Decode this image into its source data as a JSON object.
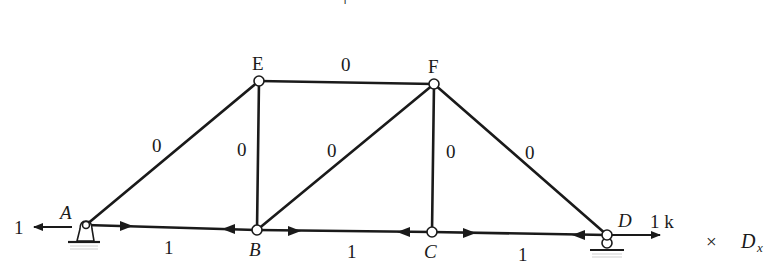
{
  "figure": {
    "type": "truss-free-body-diagram",
    "top_mark": "+",
    "joints": [
      {
        "id": "A",
        "label": "A",
        "italic": true,
        "x": 86,
        "y": 225,
        "support": "pin"
      },
      {
        "id": "B",
        "label": "B",
        "italic": true,
        "x": 257,
        "y": 230,
        "support": "none"
      },
      {
        "id": "C",
        "label": "C",
        "italic": true,
        "x": 432,
        "y": 232,
        "support": "none"
      },
      {
        "id": "D",
        "label": "D",
        "italic": true,
        "x": 607,
        "y": 235,
        "support": "roller"
      },
      {
        "id": "E",
        "label": "E",
        "italic": false,
        "x": 259,
        "y": 81,
        "support": "none"
      },
      {
        "id": "F",
        "label": "F",
        "italic": false,
        "x": 434,
        "y": 84,
        "support": "none"
      }
    ],
    "members": [
      {
        "id": "AE",
        "from": "A",
        "to": "E",
        "force": "0"
      },
      {
        "id": "EF",
        "from": "E",
        "to": "F",
        "force": "0"
      },
      {
        "id": "EB",
        "from": "E",
        "to": "B",
        "force": "0"
      },
      {
        "id": "BF",
        "from": "B",
        "to": "F",
        "force": "0"
      },
      {
        "id": "FC",
        "from": "F",
        "to": "C",
        "force": "0"
      },
      {
        "id": "FD",
        "from": "F",
        "to": "D",
        "force": "0"
      },
      {
        "id": "AB",
        "from": "A",
        "to": "B",
        "force": "1"
      },
      {
        "id": "BC",
        "from": "B",
        "to": "C",
        "force": "1"
      },
      {
        "id": "CD",
        "from": "C",
        "to": "D",
        "force": "1"
      }
    ],
    "external_loads": [
      {
        "at": "A",
        "direction": "left",
        "label": "1"
      },
      {
        "at": "D",
        "direction": "right",
        "label": "1 k"
      }
    ],
    "multiplier": {
      "symbol": "×",
      "variable": "D",
      "subscript": "x"
    }
  }
}
